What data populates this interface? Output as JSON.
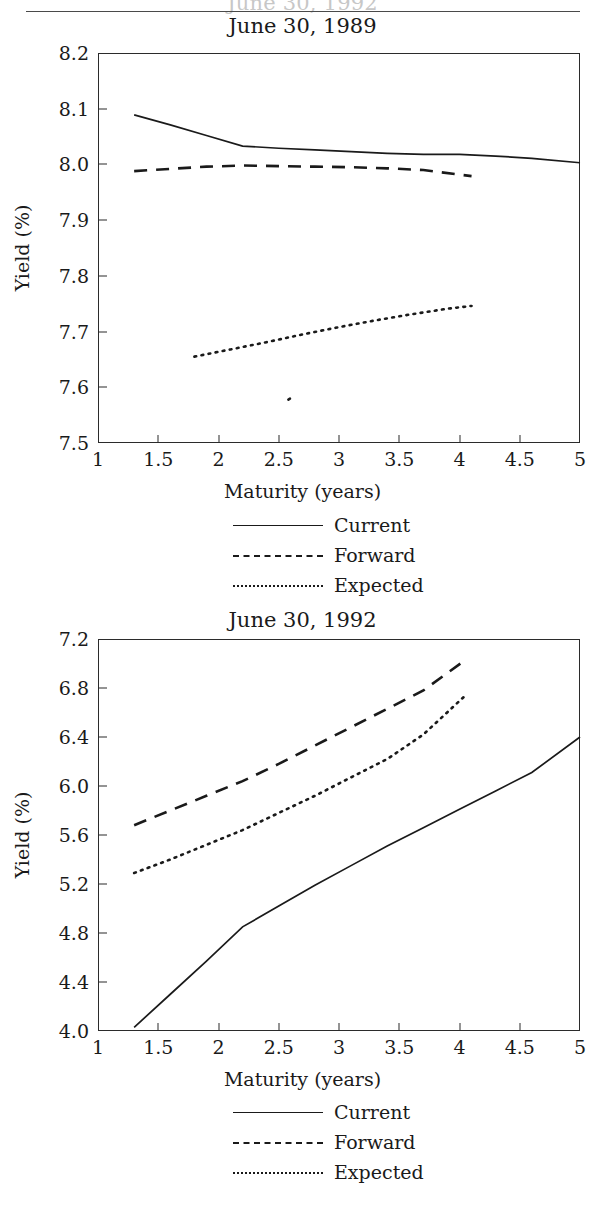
{
  "page": {
    "cut_off_top_title": "June 30, 1992"
  },
  "legend": {
    "items": [
      {
        "label": "Current",
        "style": "solid",
        "key": "line-solid-icon"
      },
      {
        "label": "Forward",
        "style": "dashed",
        "key": "line-dashed-icon"
      },
      {
        "label": "Expected",
        "style": "dotted",
        "key": "line-dotted-icon"
      }
    ]
  },
  "chart_data": [
    {
      "type": "line",
      "title": "June 30, 1989",
      "xlabel": "Maturity (years)",
      "ylabel": "Yield (%)",
      "xlim": [
        1,
        5
      ],
      "ylim": [
        7.5,
        8.2
      ],
      "xticks": [
        "1",
        "1.5",
        "2",
        "2.5",
        "3",
        "3.5",
        "4",
        "4.5",
        "5"
      ],
      "xtick_values": [
        1,
        1.5,
        2,
        2.5,
        3,
        3.5,
        4,
        4.5,
        5
      ],
      "yticks": [
        "7.5",
        "7.6",
        "7.7",
        "7.8",
        "7.9",
        "8.0",
        "8.1",
        "8.2"
      ],
      "ytick_values": [
        7.5,
        7.6,
        7.7,
        7.8,
        7.9,
        8.0,
        8.1,
        8.2
      ],
      "grid": false,
      "legend_position": "below",
      "series": [
        {
          "name": "Current",
          "style": "solid",
          "x": [
            1.3,
            1.6,
            1.9,
            2.2,
            2.5,
            2.8,
            3.1,
            3.4,
            3.7,
            4.0,
            4.3,
            4.6,
            5.0
          ],
          "y": [
            8.089,
            8.071,
            8.052,
            8.033,
            8.029,
            8.026,
            8.023,
            8.02,
            8.018,
            8.018,
            8.015,
            8.011,
            8.003
          ]
        },
        {
          "name": "Forward",
          "style": "dashed",
          "x": [
            1.3,
            1.6,
            1.9,
            2.2,
            2.5,
            2.8,
            3.1,
            3.4,
            3.7,
            4.1
          ],
          "y": [
            7.988,
            7.992,
            7.996,
            7.998,
            7.997,
            7.996,
            7.995,
            7.993,
            7.99,
            7.979
          ]
        },
        {
          "name": "Expected",
          "style": "dotted",
          "x": [
            1.8,
            2.1,
            2.4,
            2.7,
            3.0,
            3.3,
            3.6,
            3.9,
            4.1
          ],
          "y": [
            7.655,
            7.668,
            7.681,
            7.695,
            7.708,
            7.72,
            7.731,
            7.741,
            7.746
          ]
        },
        {
          "name": "stray-mark",
          "style": "dotted",
          "x": [
            2.58,
            2.62
          ],
          "y": [
            7.578,
            7.583
          ]
        }
      ]
    },
    {
      "type": "line",
      "title": "June 30, 1992",
      "xlabel": "Maturity (years)",
      "ylabel": "Yield (%)",
      "xlim": [
        1,
        5
      ],
      "ylim": [
        4.0,
        7.2
      ],
      "xticks": [
        "1",
        "1.5",
        "2",
        "2.5",
        "3",
        "3.5",
        "4",
        "4.5",
        "5"
      ],
      "xtick_values": [
        1,
        1.5,
        2,
        2.5,
        3,
        3.5,
        4,
        4.5,
        5
      ],
      "yticks": [
        "4.0",
        "4.4",
        "4.8",
        "5.2",
        "5.6",
        "6.0",
        "6.4",
        "6.8",
        "7.2"
      ],
      "ytick_values": [
        4.0,
        4.4,
        4.8,
        5.2,
        5.6,
        6.0,
        6.4,
        6.8,
        7.2
      ],
      "grid": false,
      "legend_position": "below",
      "series": [
        {
          "name": "Current",
          "style": "solid",
          "x": [
            1.3,
            1.6,
            1.9,
            2.2,
            2.5,
            2.8,
            3.1,
            3.4,
            3.7,
            4.0,
            4.3,
            4.6,
            5.0
          ],
          "y": [
            4.03,
            4.3,
            4.57,
            4.85,
            5.02,
            5.19,
            5.35,
            5.51,
            5.66,
            5.81,
            5.96,
            6.11,
            6.4
          ]
        },
        {
          "name": "Forward",
          "style": "dashed",
          "x": [
            1.3,
            1.6,
            1.9,
            2.2,
            2.5,
            2.8,
            3.1,
            3.4,
            3.7,
            4.05
          ],
          "y": [
            5.68,
            5.8,
            5.92,
            6.04,
            6.18,
            6.33,
            6.48,
            6.63,
            6.78,
            7.03
          ]
        },
        {
          "name": "Expected",
          "style": "dotted",
          "x": [
            1.3,
            1.6,
            1.9,
            2.2,
            2.5,
            2.8,
            3.1,
            3.4,
            3.7,
            4.05
          ],
          "y": [
            5.29,
            5.4,
            5.52,
            5.64,
            5.78,
            5.92,
            6.07,
            6.22,
            6.42,
            6.74
          ]
        }
      ]
    }
  ]
}
